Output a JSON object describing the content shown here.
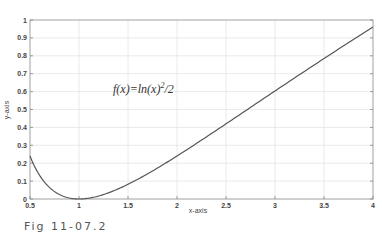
{
  "caption": "Fig 11-07.2",
  "chart_data": {
    "type": "line",
    "title": "",
    "annotation": {
      "text": "f(x)=ln(x)",
      "sup": "2",
      "suffix": "/2",
      "x": 1.8,
      "y": 0.6
    },
    "xlabel": "x-axis",
    "ylabel": "y-axis",
    "xlim": [
      0.5,
      4
    ],
    "ylim": [
      0,
      1
    ],
    "xticks": [
      0.5,
      1,
      1.5,
      2,
      2.5,
      3,
      3.5,
      4
    ],
    "xtick_labels": [
      "0.5",
      "1",
      "1.5",
      "2",
      "2.5",
      "3",
      "3.5",
      "4"
    ],
    "yticks": [
      0,
      0.1,
      0.2,
      0.3,
      0.4,
      0.5,
      0.6,
      0.7,
      0.8,
      0.9,
      1
    ],
    "ytick_labels": [
      "0",
      "0.1",
      "0.2",
      "0.3",
      "0.4",
      "0.5",
      "0.6",
      "0.7",
      "0.8",
      "0.9",
      "1"
    ],
    "grid": true,
    "series": [
      {
        "name": "f(x)=ln(x)^2/2",
        "color": "#555555",
        "x": [
          0.5,
          0.6,
          0.7,
          0.8,
          0.9,
          1.0,
          1.25,
          1.5,
          1.75,
          2.0,
          2.25,
          2.5,
          2.75,
          3.0,
          3.25,
          3.5,
          3.75,
          4.0
        ],
        "y": [
          0.24,
          0.13,
          0.064,
          0.025,
          0.006,
          0.0,
          0.025,
          0.082,
          0.157,
          0.24,
          0.329,
          0.42,
          0.512,
          0.603,
          0.694,
          0.785,
          0.874,
          0.961
        ]
      }
    ]
  }
}
